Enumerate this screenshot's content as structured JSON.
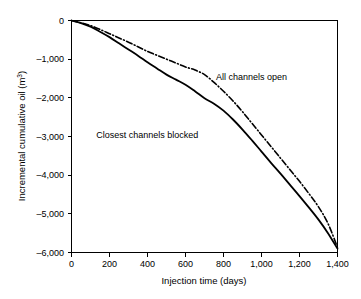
{
  "chart_data": {
    "type": "line",
    "title": "",
    "xlabel": "Injection time (days)",
    "ylabel": "Incremental cumulative oil (m3)",
    "ylabel_base": "Incremental cumulative oil (m",
    "ylabel_sup": "3",
    "ylabel_close": ")",
    "xlim": [
      0,
      1400
    ],
    "ylim": [
      -6000,
      0
    ],
    "grid": false,
    "legend_position": "inline-annotations",
    "x_ticks": [
      0,
      200,
      400,
      600,
      800,
      1000,
      1200,
      1400
    ],
    "x_tick_labels": [
      "0",
      "200",
      "400",
      "600",
      "800",
      "1,000",
      "1,200",
      "1,400"
    ],
    "y_ticks": [
      0,
      -1000,
      -2000,
      -3000,
      -4000,
      -5000,
      -6000
    ],
    "y_tick_labels": [
      "0",
      "–1,000",
      "–2,000",
      "–3,000",
      "–4,000",
      "–5,000",
      "–6,000"
    ],
    "series": [
      {
        "name": "All channels open",
        "style": "dash-dot",
        "color": "#000000",
        "x": [
          0,
          50,
          100,
          150,
          200,
          250,
          300,
          350,
          400,
          450,
          500,
          550,
          600,
          650,
          700,
          750,
          800,
          850,
          900,
          950,
          1000,
          1050,
          1100,
          1150,
          1200,
          1250,
          1300,
          1350,
          1400
        ],
        "values": [
          0,
          -60,
          -130,
          -230,
          -340,
          -450,
          -560,
          -680,
          -800,
          -900,
          -1000,
          -1100,
          -1200,
          -1280,
          -1400,
          -1600,
          -1830,
          -2080,
          -2360,
          -2660,
          -2960,
          -3260,
          -3560,
          -3860,
          -4160,
          -4480,
          -4820,
          -5250,
          -5870
        ]
      },
      {
        "name": "Closest channels blocked",
        "style": "solid",
        "color": "#000000",
        "x": [
          0,
          50,
          100,
          150,
          200,
          250,
          300,
          350,
          400,
          450,
          500,
          550,
          600,
          650,
          700,
          750,
          800,
          850,
          900,
          950,
          1000,
          1050,
          1100,
          1150,
          1200,
          1250,
          1300,
          1350,
          1400
        ],
        "values": [
          0,
          -70,
          -160,
          -290,
          -430,
          -590,
          -750,
          -910,
          -1080,
          -1240,
          -1400,
          -1530,
          -1660,
          -1830,
          -2010,
          -2150,
          -2330,
          -2560,
          -2820,
          -3100,
          -3390,
          -3680,
          -3960,
          -4250,
          -4540,
          -4840,
          -5150,
          -5500,
          -5900
        ]
      }
    ],
    "annotations": [
      {
        "text": "All channels open",
        "x": 760,
        "y": -1530
      },
      {
        "text": "Closest channels blocked",
        "x": 130,
        "y": -3030
      }
    ]
  }
}
